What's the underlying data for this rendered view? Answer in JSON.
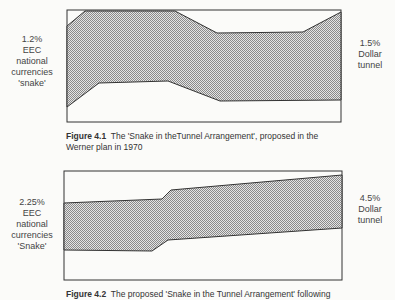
{
  "figure1": {
    "left_label": [
      "1.2%",
      "EEC",
      "national",
      "currencies",
      "'snake'"
    ],
    "right_label": [
      "1.5%",
      "Dollar",
      "tunnel"
    ],
    "caption_num": "Figure 4.1",
    "caption_text": "The 'Snake in theTunnel Arrangement',  proposed in the",
    "caption_text2": "Werner plan in 1970"
  },
  "figure2": {
    "left_label": [
      "2.25%",
      "EEC",
      "national",
      "currencies",
      "'Snake'"
    ],
    "right_label": [
      "4.5%",
      "Dollar",
      "tunnel"
    ],
    "caption_num": "Figure 4.2",
    "caption_text": "The proposed 'Snake in the Tunnel Arrangement' following"
  },
  "colors": {
    "fill": "#b8b8b8",
    "line": "#333333",
    "background": "#fbfbf9"
  }
}
